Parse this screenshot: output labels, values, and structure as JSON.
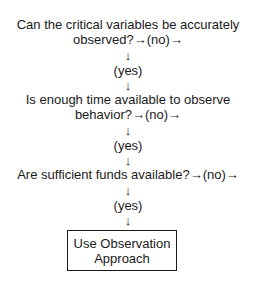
{
  "flowchart": {
    "q1": {
      "line1": "Can the critical variables be accurately",
      "line2": "observed?→(no)→"
    },
    "a1_down": "↓",
    "a1_yes": "(yes)",
    "a1_down2": "↓",
    "q2": {
      "line1": "Is enough time available to observe",
      "line2": "behavior?→(no)→"
    },
    "a2_down": "↓",
    "a2_yes": "(yes)",
    "a2_down2": "↓",
    "q3": {
      "line1": "Are sufficient funds available?→(no)→"
    },
    "a3_down": "↓",
    "a3_yes": "(yes)",
    "a3_down2": "↓",
    "result": {
      "line1": "Use Observation",
      "line2": "Approach"
    }
  }
}
